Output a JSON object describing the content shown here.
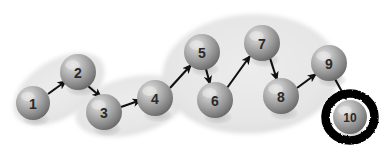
{
  "diagram": {
    "canvas": {
      "width": 390,
      "height": 150,
      "background": "#ffffff"
    },
    "colors": {
      "cluster_fill": "#e7e7e7",
      "cluster_edge": "#dcdcdc",
      "sphere_light": "#d8d8d8",
      "sphere_mid": "#9a9a9a",
      "sphere_dark": "#6e6e6e",
      "sphere_shadow": "#b5b5b5",
      "arrow": "#101010",
      "highlight_ring": "#000000",
      "label_text": "#2a2a2a"
    },
    "nodes": [
      {
        "id": "1",
        "label": "1",
        "cx": 33,
        "cy": 103,
        "r": 17,
        "highlighted": false,
        "cluster": "cluster-a"
      },
      {
        "id": "2",
        "label": "2",
        "cx": 78,
        "cy": 72,
        "r": 18,
        "highlighted": false,
        "cluster": "cluster-a"
      },
      {
        "id": "3",
        "label": "3",
        "cx": 104,
        "cy": 112,
        "r": 18,
        "highlighted": false,
        "cluster": "cluster-b"
      },
      {
        "id": "4",
        "label": "4",
        "cx": 155,
        "cy": 98,
        "r": 18,
        "highlighted": false,
        "cluster": "cluster-b"
      },
      {
        "id": "5",
        "label": "5",
        "cx": 202,
        "cy": 52,
        "r": 18,
        "highlighted": false,
        "cluster": "cluster-c"
      },
      {
        "id": "6",
        "label": "6",
        "cx": 215,
        "cy": 100,
        "r": 18,
        "highlighted": false,
        "cluster": "cluster-c"
      },
      {
        "id": "7",
        "label": "7",
        "cx": 262,
        "cy": 43,
        "r": 18,
        "highlighted": false,
        "cluster": "cluster-c"
      },
      {
        "id": "8",
        "label": "8",
        "cx": 281,
        "cy": 96,
        "r": 18,
        "highlighted": false,
        "cluster": "cluster-c"
      },
      {
        "id": "9",
        "label": "9",
        "cx": 329,
        "cy": 63,
        "r": 18,
        "highlighted": false,
        "cluster": "cluster-c"
      },
      {
        "id": "10",
        "label": "10",
        "cx": 350,
        "cy": 117,
        "r": 17,
        "highlighted": true,
        "cluster": null
      }
    ],
    "edges": [
      {
        "id": "e1",
        "from": "1",
        "to": "2",
        "x1": 48,
        "y1": 94,
        "x2": 66,
        "y2": 81
      },
      {
        "id": "e2",
        "from": "2",
        "to": "3",
        "x1": 88,
        "y1": 86,
        "x2": 101,
        "y2": 97
      },
      {
        "id": "e3",
        "from": "3",
        "to": "4",
        "x1": 121,
        "y1": 107,
        "x2": 141,
        "y2": 100
      },
      {
        "id": "e4",
        "from": "4",
        "to": "5",
        "x1": 170,
        "y1": 88,
        "x2": 191,
        "y2": 65
      },
      {
        "id": "e5",
        "from": "5",
        "to": "6",
        "x1": 206,
        "y1": 69,
        "x2": 210,
        "y2": 84
      },
      {
        "id": "e6",
        "from": "6",
        "to": "7",
        "x1": 227,
        "y1": 88,
        "x2": 250,
        "y2": 56
      },
      {
        "id": "e7",
        "from": "7",
        "to": "8",
        "x1": 270,
        "y1": 58,
        "x2": 277,
        "y2": 80
      },
      {
        "id": "e8",
        "from": "8",
        "to": "9",
        "x1": 297,
        "y1": 88,
        "x2": 316,
        "y2": 74
      },
      {
        "id": "e9",
        "from": "9",
        "to": "10",
        "x1": 335,
        "y1": 79,
        "x2": 346,
        "y2": 99
      }
    ],
    "clusters": [
      {
        "id": "cluster-a",
        "label": "cluster-a",
        "cx": 59,
        "cy": 89,
        "rx": 50,
        "ry": 28,
        "rotation": -32,
        "members": [
          "1",
          "2"
        ]
      },
      {
        "id": "cluster-b",
        "label": "cluster-b",
        "cx": 131,
        "cy": 106,
        "rx": 56,
        "ry": 28,
        "rotation": -14,
        "members": [
          "3",
          "4"
        ]
      },
      {
        "id": "cluster-c",
        "label": "cluster-c",
        "cx": 251,
        "cy": 74,
        "rx": 88,
        "ry": 59,
        "rotation": -3,
        "members": [
          "5",
          "6",
          "7",
          "8",
          "9"
        ]
      }
    ]
  }
}
